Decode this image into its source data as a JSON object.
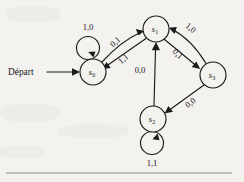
{
  "figure": {
    "start_label": "Départ",
    "background_color": "#f3f2ef",
    "ink_color": "#1b1b1b",
    "rule_color": "#8e8d89"
  },
  "states": [
    {
      "id": "s0",
      "name": "s",
      "subscript": "0",
      "cx": 93,
      "cy": 72,
      "r": 13
    },
    {
      "id": "s1",
      "name": "s",
      "subscript": "1",
      "cx": 156,
      "cy": 29,
      "r": 13
    },
    {
      "id": "s2",
      "name": "s",
      "subscript": "2",
      "cx": 153,
      "cy": 119,
      "r": 13
    },
    {
      "id": "s3",
      "name": "s",
      "subscript": "3",
      "cx": 213,
      "cy": 75,
      "r": 13
    }
  ],
  "transitions": [
    {
      "from": "s0",
      "to": "s0",
      "label": "1,0",
      "kind": "self-loop-top"
    },
    {
      "from": "s0",
      "to": "s1",
      "label": "0,1",
      "kind": "arc-upper"
    },
    {
      "from": "s1",
      "to": "s0",
      "label": "1,1",
      "kind": "arc-lower"
    },
    {
      "from": "s3",
      "to": "s1",
      "label": "1,0",
      "kind": "arc-upper"
    },
    {
      "from": "s1",
      "to": "s3",
      "label": "0,1",
      "kind": "arc-lower"
    },
    {
      "from": "s2",
      "to": "s1",
      "label": "0,0",
      "kind": "straight-vertical"
    },
    {
      "from": "s3",
      "to": "s2",
      "label": "0,0",
      "kind": "straight-diagonal"
    },
    {
      "from": "s2",
      "to": "s2",
      "label": "1,1",
      "kind": "self-loop-bottom"
    }
  ],
  "labels": {
    "loop_s0": "1,0",
    "s0_to_s1": "0,1",
    "s1_to_s0": "1,1",
    "s3_to_s1": "1,0",
    "s1_to_s3": "0,1",
    "s2_to_s1": "0,0",
    "s3_to_s2": "0,0",
    "loop_s2": "1,1"
  }
}
